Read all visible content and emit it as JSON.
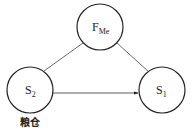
{
  "diagram": {
    "type": "su-field-model",
    "nodes": [
      {
        "id": "field",
        "label": "F",
        "subscript": "Me",
        "cx": 100,
        "cy": 27,
        "r": 23
      },
      {
        "id": "s2",
        "label": "S",
        "subscript": "2",
        "cx": 30,
        "cy": 90,
        "r": 23,
        "annotation": "粮仓"
      },
      {
        "id": "s1",
        "label": "S",
        "subscript": "1",
        "cx": 162,
        "cy": 90,
        "r": 23
      }
    ],
    "edges": [
      {
        "from": "field",
        "to": "s2",
        "style": "line"
      },
      {
        "from": "field",
        "to": "s1",
        "style": "line"
      },
      {
        "from": "s2",
        "to": "s1",
        "style": "arrow"
      }
    ],
    "caption": "…粮仓与昆虫的作用…"
  },
  "colors": {
    "stroke": "#222222",
    "background": "#ffffff"
  }
}
